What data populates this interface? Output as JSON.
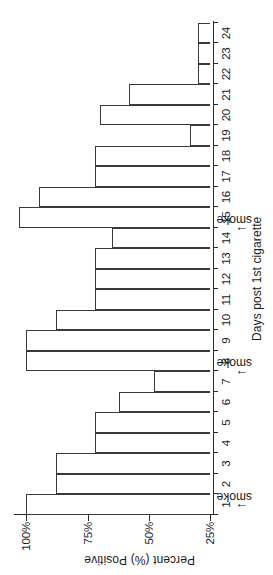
{
  "chart_data": {
    "type": "bar",
    "title": "",
    "xlabel": "Days post 1st cigarette",
    "ylabel": "Percent (%) Positive",
    "categories": [
      "1",
      "2",
      "3",
      "4",
      "5",
      "6",
      "7",
      "8",
      "9",
      "10",
      "11",
      "12",
      "13",
      "14",
      "15",
      "16",
      "17",
      "18",
      "19",
      "20",
      "21",
      "22",
      "23",
      "24"
    ],
    "values": [
      100,
      88,
      88,
      72,
      72,
      62,
      48,
      100,
      100,
      88,
      72,
      72,
      72,
      65,
      103,
      95,
      72,
      72,
      33,
      70,
      58,
      30,
      30,
      30
    ],
    "ylim": [
      25,
      105
    ],
    "ytick_values": [
      25,
      50,
      75,
      100
    ],
    "ytick_labels": [
      "25%",
      "50%",
      "75%",
      "100%"
    ],
    "grid": false,
    "legend": null,
    "annotations": [
      {
        "label": "smoke",
        "at_x": 1
      },
      {
        "label": "smoke",
        "at_x": 7.5
      },
      {
        "label": "smoke",
        "at_x": 14.5
      }
    ]
  },
  "colors": {
    "bar_fill": "#ffffff",
    "bar_stroke": "#3a3a3a",
    "axis": "#2b2b2b",
    "text": "#1a1a1a",
    "background": "#ffffff"
  }
}
